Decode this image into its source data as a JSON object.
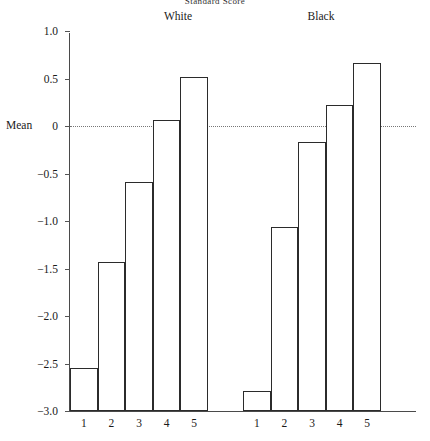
{
  "chart_data": {
    "type": "bar",
    "title": "Standard Score",
    "ylabel": "Mean",
    "xlabel": "",
    "ylim": [
      -3.0,
      1.0
    ],
    "yticks": [
      1.0,
      0.5,
      0,
      -0.5,
      -1.0,
      -1.5,
      -2.0,
      -2.5,
      -3.0
    ],
    "ytick_labels": [
      "1.0",
      "0.5",
      "0",
      "−0.5",
      "−1.0",
      "−1.5",
      "−2.0",
      "−2.5",
      "−3.0"
    ],
    "grid": false,
    "zero_reference_line": true,
    "zero_reference_style": "dotted",
    "legend": "none",
    "group_labels": [
      "White",
      "Black"
    ],
    "categories": [
      "1",
      "2",
      "3",
      "4",
      "5"
    ],
    "series": [
      {
        "name": "White",
        "categories": [
          "1",
          "2",
          "3",
          "4",
          "5"
        ],
        "values": [
          -2.55,
          -1.43,
          -0.59,
          0.06,
          0.52
        ]
      },
      {
        "name": "Black",
        "categories": [
          "1",
          "2",
          "3",
          "4",
          "5"
        ],
        "values": [
          -2.79,
          -1.06,
          -0.17,
          0.22,
          0.66
        ]
      }
    ],
    "bar_style": {
      "fill": "#ffffff",
      "edge": "#2b2b2b",
      "adjacent": true
    }
  },
  "axis": {
    "y_label_text": "Mean"
  }
}
